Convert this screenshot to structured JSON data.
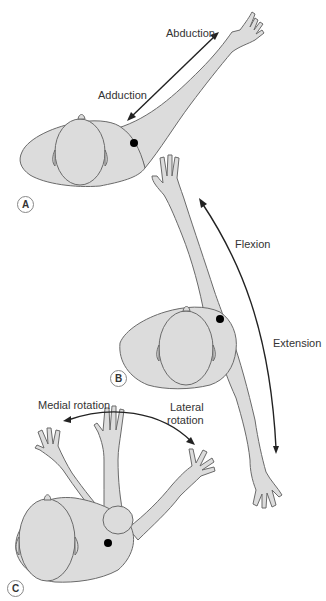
{
  "figure": {
    "colors": {
      "body_fill": "#dcdcdc",
      "outline": "#6a6a6a",
      "arrow": "#222222",
      "joint_marker": "#000000",
      "text": "#333333"
    }
  },
  "panels": [
    {
      "id": "A",
      "badge": "A",
      "movement_labels": [
        "Abduction",
        "Adduction"
      ]
    },
    {
      "id": "B",
      "badge": "B",
      "movement_labels": [
        "Flexion",
        "Extension"
      ]
    },
    {
      "id": "C",
      "badge": "C",
      "movement_labels": [
        "Medial rotation",
        "Lateral",
        "rotation"
      ]
    }
  ]
}
